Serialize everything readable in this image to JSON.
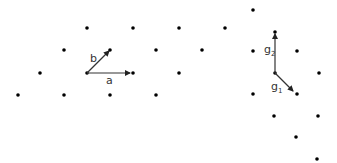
{
  "left_lattice": {
    "points": [
      [
        87,
        28
      ],
      [
        133,
        28
      ],
      [
        179,
        28
      ],
      [
        225,
        28
      ],
      [
        64,
        50
      ],
      [
        110,
        50
      ],
      [
        156,
        50
      ],
      [
        202,
        50
      ],
      [
        40,
        73
      ],
      [
        87,
        73
      ],
      [
        133,
        73
      ],
      [
        179,
        73
      ],
      [
        18,
        95
      ],
      [
        64,
        95
      ],
      [
        110,
        95
      ],
      [
        156,
        95
      ]
    ],
    "origin": [
      87,
      73
    ],
    "vectors": [
      {
        "name": "a",
        "from": [
          87,
          73
        ],
        "to": [
          130,
          73
        ],
        "label": "a",
        "label_pos": [
          106,
          84
        ]
      },
      {
        "name": "b",
        "from": [
          87,
          73
        ],
        "to": [
          109,
          51
        ],
        "label": "b",
        "label_pos": [
          90,
          62
        ]
      }
    ]
  },
  "right_lattice": {
    "points": [
      [
        253,
        10
      ],
      [
        275,
        32
      ],
      [
        253,
        51
      ],
      [
        297,
        51
      ],
      [
        319,
        73
      ],
      [
        253,
        94
      ],
      [
        297,
        94
      ],
      [
        274,
        116
      ],
      [
        318,
        116
      ],
      [
        296,
        137
      ],
      [
        317,
        159
      ],
      [
        275,
        73
      ]
    ],
    "origin": [
      275,
      73
    ],
    "vectors": [
      {
        "name": "g1",
        "from": [
          275,
          73
        ],
        "to": [
          293,
          91
        ],
        "label": "g",
        "subscript": "1",
        "label_pos": [
          271,
          90
        ]
      },
      {
        "name": "g2",
        "from": [
          275,
          73
        ],
        "to": [
          275,
          34
        ],
        "label": "g",
        "subscript": "2",
        "label_pos": [
          264,
          53
        ]
      }
    ]
  },
  "colors": {
    "dot": "#000000",
    "arrow": "#333333"
  }
}
